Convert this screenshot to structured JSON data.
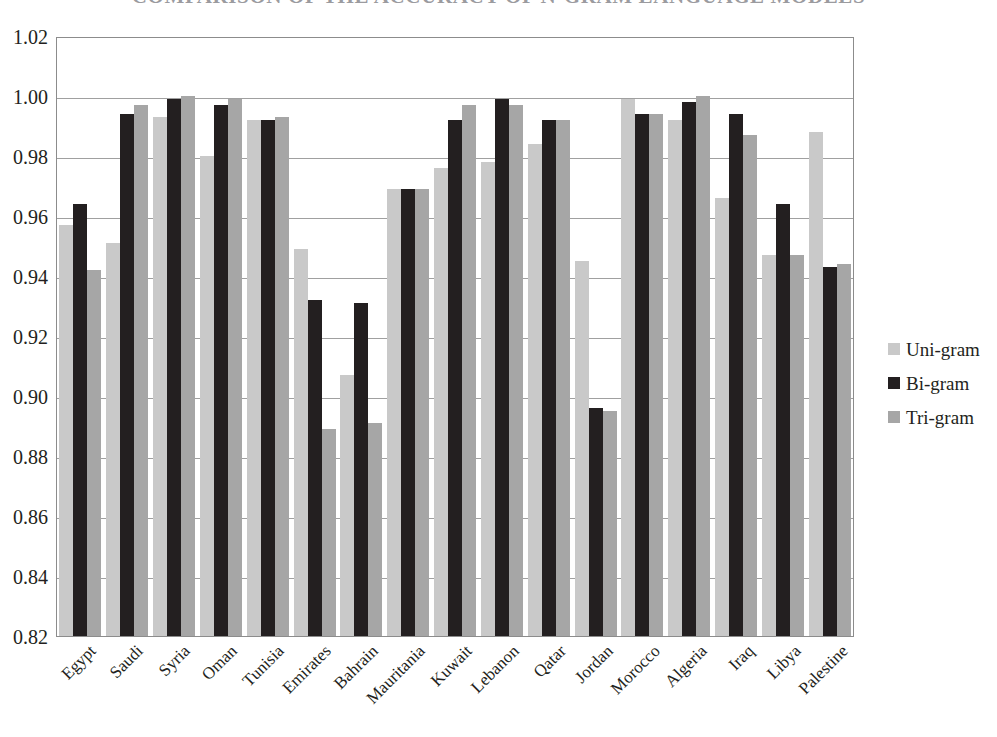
{
  "chart_data": {
    "type": "bar",
    "title": "COMPARISON OF THE ACCURACY OF N-GRAM LANGUAGE MODELS",
    "title_visible": false,
    "xlabel": "",
    "ylabel": "",
    "ylim": [
      0.82,
      1.02
    ],
    "ytick_step": 0.02,
    "grid": true,
    "legend_position": "right",
    "ytick_labels": [
      "1.02",
      "1.00",
      "0.98",
      "0.96",
      "0.94",
      "0.92",
      "0.90",
      "0.88",
      "0.86",
      "0.84",
      "0.82"
    ],
    "ytick_values": [
      1.02,
      1.0,
      0.98,
      0.96,
      0.94,
      0.92,
      0.9,
      0.88,
      0.86,
      0.84,
      0.82
    ],
    "categories": [
      "Egypt",
      "Saudi",
      "Syria",
      "Oman",
      "Tunisia",
      "Emirates",
      "Bahrain",
      "Mauritania",
      "Kuwait",
      "Lebanon",
      "Qatar",
      "Jordan",
      "Morocco",
      "Algeria",
      "Iraq",
      "Libya",
      "Palestine"
    ],
    "series": [
      {
        "name": "Uni-gram",
        "color": "#c9c9c9",
        "values": [
          0.957,
          0.951,
          0.993,
          0.98,
          0.992,
          0.949,
          0.907,
          0.969,
          0.976,
          0.978,
          0.984,
          0.945,
          0.999,
          0.992,
          0.966,
          0.947,
          0.988
        ]
      },
      {
        "name": "Bi-gram",
        "color": "#231f20",
        "values": [
          0.964,
          0.994,
          0.999,
          0.997,
          0.992,
          0.932,
          0.931,
          0.969,
          0.992,
          0.999,
          0.992,
          0.896,
          0.994,
          0.998,
          0.994,
          0.964,
          0.943
        ]
      },
      {
        "name": "Tri-gram",
        "color": "#a6a6a6",
        "values": [
          0.942,
          0.997,
          1.0,
          0.999,
          0.993,
          0.889,
          0.891,
          0.969,
          0.997,
          0.997,
          0.992,
          0.895,
          0.994,
          1.0,
          0.987,
          0.947,
          0.944
        ]
      }
    ]
  },
  "legend": {
    "items": [
      {
        "label": "Uni-gram",
        "color": "#c9c9c9"
      },
      {
        "label": "Bi-gram",
        "color": "#231f20"
      },
      {
        "label": "Tri-gram",
        "color": "#a6a6a6"
      }
    ]
  }
}
